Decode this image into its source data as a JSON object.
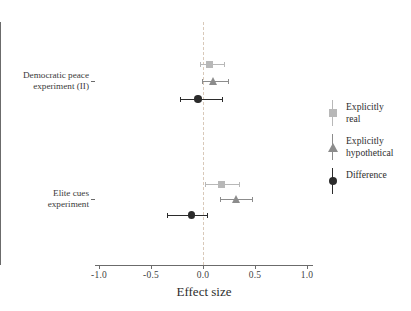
{
  "chart_data": {
    "type": "scatter",
    "title": "",
    "xlabel": "Effect size",
    "ylabel": "",
    "xlim": [
      -1.15,
      1.15
    ],
    "xticks": [
      -1.0,
      -0.5,
      0.0,
      0.5,
      1.0
    ],
    "xticklabels": [
      "-1.0",
      "-0.5",
      "0.0",
      "0.5",
      "1.0"
    ],
    "grid": false,
    "zero_reference_line": 0.0,
    "legend_position": "right",
    "categories": [
      "Democratic peace experiment (II)",
      "Elite cues experiment"
    ],
    "series": [
      {
        "name": "Explicitly real",
        "marker": "square",
        "color": "#b8b8b8",
        "values": [
          0.06,
          0.18
        ],
        "ci_low": [
          -0.03,
          0.02
        ],
        "ci_high": [
          0.2,
          0.35
        ]
      },
      {
        "name": "Explicitly hypothetical",
        "marker": "triangle",
        "color": "#8c8c8c",
        "values": [
          0.1,
          0.32
        ],
        "ci_low": [
          -0.01,
          0.16
        ],
        "ci_high": [
          0.24,
          0.47
        ]
      },
      {
        "name": "Difference",
        "marker": "circle",
        "color": "#2b2b2b",
        "values": [
          -0.05,
          -0.11
        ],
        "ci_low": [
          -0.22,
          -0.35
        ],
        "ci_high": [
          0.18,
          0.04
        ]
      }
    ],
    "points": [
      {
        "group": 0,
        "series": "Explicitly real",
        "y_px": 64,
        "value": 0.06,
        "ci_low": -0.03,
        "ci_high": 0.2,
        "marker": "square",
        "color": "#b8b8b8"
      },
      {
        "group": 0,
        "series": "Explicitly hypothetical",
        "y_px": 81,
        "value": 0.1,
        "ci_low": -0.01,
        "ci_high": 0.24,
        "marker": "triangle",
        "color": "#8c8c8c"
      },
      {
        "group": 0,
        "series": "Difference",
        "y_px": 99,
        "value": -0.05,
        "ci_low": -0.22,
        "ci_high": 0.18,
        "marker": "circle",
        "color": "#2b2b2b"
      },
      {
        "group": 1,
        "series": "Explicitly real",
        "y_px": 184,
        "value": 0.18,
        "ci_low": 0.02,
        "ci_high": 0.35,
        "marker": "square",
        "color": "#b8b8b8"
      },
      {
        "group": 1,
        "series": "Explicitly hypothetical",
        "y_px": 199,
        "value": 0.32,
        "ci_low": 0.16,
        "ci_high": 0.47,
        "marker": "triangle",
        "color": "#8c8c8c"
      },
      {
        "group": 1,
        "series": "Difference",
        "y_px": 215,
        "value": -0.11,
        "ci_low": -0.35,
        "ci_high": 0.04,
        "marker": "circle",
        "color": "#2b2b2b"
      }
    ]
  },
  "axis": {
    "x_title": "Effect size",
    "tick_labels": [
      "-1.0",
      "-0.5",
      "0.0",
      "0.5",
      "1.0"
    ]
  },
  "categories": [
    {
      "line1": "Democratic peace",
      "line2": "experiment (II)",
      "y_px": 81
    },
    {
      "line1": "Elite cues",
      "line2": "experiment",
      "y_px": 199
    }
  ],
  "legend": {
    "items": [
      {
        "label_line1": "Explicitly",
        "label_line2": "real",
        "marker": "square",
        "color": "#b8b8b8"
      },
      {
        "label_line1": "Explicitly",
        "label_line2": "hypothetical",
        "marker": "triangle",
        "color": "#8c8c8c"
      },
      {
        "label_line1": "Difference",
        "label_line2": "",
        "marker": "circle",
        "color": "#2b2b2b"
      }
    ]
  },
  "colors": {
    "axis": "#6b6b6b",
    "zero_line": "#d9c9b9",
    "background": "#ffffff",
    "text": "#2e2e2e"
  }
}
